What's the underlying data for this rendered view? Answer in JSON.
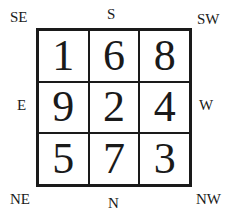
{
  "directions": {
    "se": "SE",
    "s": "S",
    "sw": "SW",
    "e": "E",
    "w": "W",
    "ne": "NE",
    "n": "N",
    "nw": "NW"
  },
  "grid": [
    [
      "1",
      "6",
      "8"
    ],
    [
      "9",
      "2",
      "4"
    ],
    [
      "5",
      "7",
      "3"
    ]
  ]
}
